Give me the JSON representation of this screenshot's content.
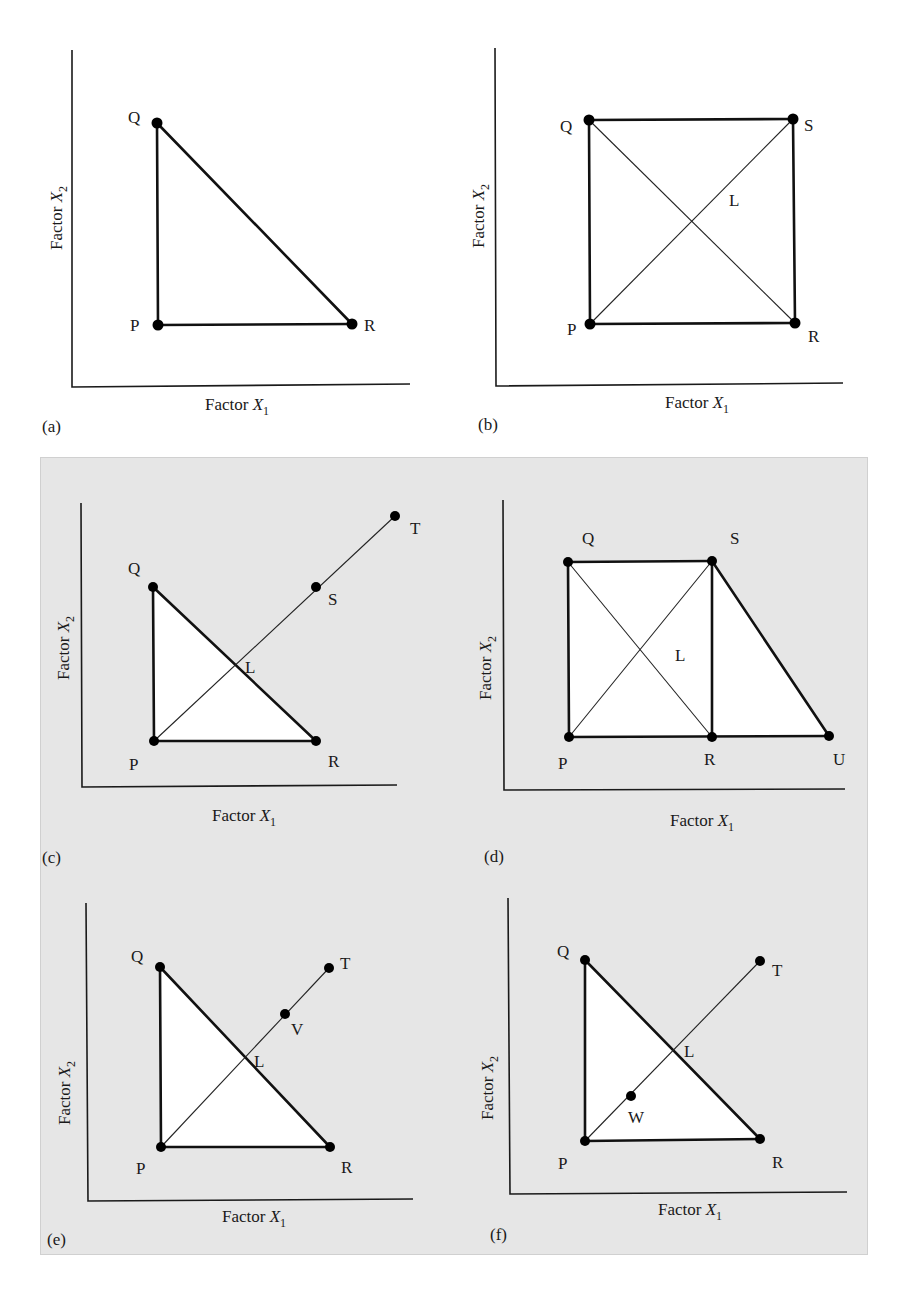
{
  "figure": {
    "axis_labels": {
      "x": "Factor X",
      "x_sub": "1",
      "y": "Factor X",
      "y_sub": "2"
    },
    "panels": [
      {
        "tag": "(a)",
        "shape": "triangle PQR",
        "points": [
          {
            "label": "Q",
            "x": 157,
            "y": 123
          },
          {
            "label": "P",
            "x": 158,
            "y": 325
          },
          {
            "label": "R",
            "x": 352,
            "y": 324
          }
        ]
      },
      {
        "tag": "(b)",
        "shape": "square PQSR with diagonals PS and QR intersecting near L",
        "points": [
          {
            "label": "Q",
            "x": 589,
            "y": 120
          },
          {
            "label": "S",
            "x": 793,
            "y": 119
          },
          {
            "label": "P",
            "x": 590,
            "y": 324
          },
          {
            "label": "R",
            "x": 795,
            "y": 323
          }
        ],
        "extra_labels": [
          {
            "label": "L"
          }
        ]
      },
      {
        "tag": "(c)",
        "shape": "triangle PQR with ray P-L-S-T",
        "points": [
          {
            "label": "Q"
          },
          {
            "label": "P"
          },
          {
            "label": "R"
          },
          {
            "label": "S"
          },
          {
            "label": "T"
          }
        ],
        "extra_labels": [
          {
            "label": "L"
          }
        ]
      },
      {
        "tag": "(d)",
        "shape": "square PQSR with diagonals plus triangle SRU",
        "points": [
          {
            "label": "Q"
          },
          {
            "label": "S"
          },
          {
            "label": "P"
          },
          {
            "label": "R"
          },
          {
            "label": "U"
          }
        ],
        "extra_labels": [
          {
            "label": "L"
          }
        ]
      },
      {
        "tag": "(e)",
        "shape": "triangle PQR with ray P-L-V-T",
        "points": [
          {
            "label": "Q"
          },
          {
            "label": "T"
          },
          {
            "label": "V"
          },
          {
            "label": "P"
          },
          {
            "label": "R"
          }
        ],
        "extra_labels": [
          {
            "label": "L"
          }
        ]
      },
      {
        "tag": "(f)",
        "shape": "triangle PQR with ray P-W-L-T",
        "points": [
          {
            "label": "Q"
          },
          {
            "label": "T"
          },
          {
            "label": "W"
          },
          {
            "label": "P"
          },
          {
            "label": "R"
          }
        ],
        "extra_labels": [
          {
            "label": "L"
          }
        ]
      }
    ],
    "colors": {
      "background": "#ffffff",
      "shaded_panel": "#e6e6e6",
      "region_fill": "#ffffff",
      "ink": "#111111"
    }
  },
  "labels": {
    "P": "P",
    "Q": "Q",
    "R": "R",
    "S": "S",
    "T": "T",
    "U": "U",
    "V": "V",
    "W": "W",
    "L": "L"
  },
  "tags": {
    "a": "(a)",
    "b": "(b)",
    "c": "(c)",
    "d": "(d)",
    "e": "(e)",
    "f": "(f)"
  }
}
